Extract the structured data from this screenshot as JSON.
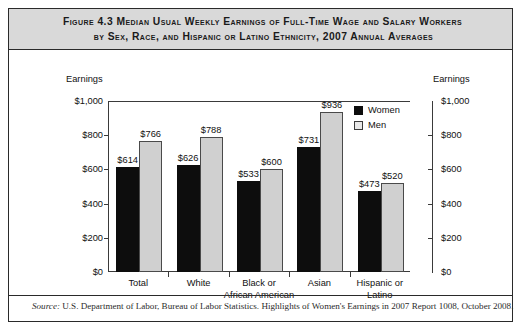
{
  "figure": {
    "title_line1": "Figure 4.3    Median Usual Weekly Earnings of Full-Time Wage and Salary Workers",
    "title_line2": "by Sex, Race, and Hispanic or Latino Ethnicity, 2007 Annual Averages",
    "source_prefix": "Source:",
    "source_text": "U.S. Department of Labor, Bureau of Labor Statistics. Highlights of Women's Earnings in 2007 Report 1008, October 2008."
  },
  "axis": {
    "left_caption": "Earnings",
    "right_caption": "Earnings",
    "ticks": [
      "$1,000",
      "$800",
      "$600",
      "$400",
      "$200",
      "$0"
    ],
    "tick_values": [
      1000,
      800,
      600,
      400,
      200,
      0
    ]
  },
  "legend": {
    "position": "inside-top-right",
    "items": [
      {
        "label": "Women",
        "color": "#0d0d0d"
      },
      {
        "label": "Men",
        "color": "#d0d0d0"
      }
    ]
  },
  "chart_data": {
    "type": "bar",
    "title": "Median Usual Weekly Earnings of Full-Time Wage and Salary Workers by Sex, Race, and Hispanic or Latino Ethnicity, 2007 Annual Averages",
    "xlabel": "",
    "ylabel": "Earnings",
    "ylim": [
      0,
      1000
    ],
    "yticks": [
      0,
      200,
      400,
      600,
      800,
      1000
    ],
    "ytick_labels": [
      "$0",
      "$200",
      "$400",
      "$600",
      "$800",
      "$1,000"
    ],
    "grid": false,
    "legend_position": "upper right (inside plot)",
    "categories": [
      "Total",
      "White",
      "Black or African American",
      "Asian",
      "Hispanic or Latino"
    ],
    "category_label_lines": [
      [
        "Total"
      ],
      [
        "White"
      ],
      [
        "Black or",
        "African American"
      ],
      [
        "Asian"
      ],
      [
        "Hispanic or",
        "Latino"
      ]
    ],
    "series": [
      {
        "name": "Women",
        "color": "#0d0d0d",
        "values": [
          614,
          626,
          533,
          731,
          473
        ],
        "labels": [
          "$614",
          "$626",
          "$533",
          "$731",
          "$473"
        ]
      },
      {
        "name": "Men",
        "color": "#d0d0d0",
        "values": [
          766,
          788,
          600,
          936,
          520
        ],
        "labels": [
          "$766",
          "$788",
          "$600",
          "$936",
          "$520"
        ]
      }
    ]
  }
}
